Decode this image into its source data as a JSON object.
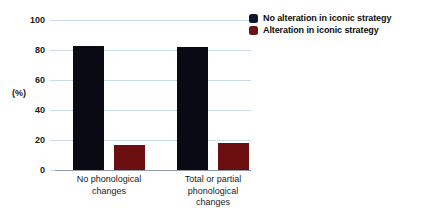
{
  "chart_data": {
    "type": "bar",
    "title": "",
    "xlabel": "",
    "ylabel": "(%)",
    "ylim": [
      0,
      100
    ],
    "yticks": [
      0,
      20,
      40,
      60,
      80,
      100
    ],
    "ytick_labels": [
      "0",
      "20",
      "40",
      "60",
      "80",
      "100"
    ],
    "grid": true,
    "legend_position": "top-right",
    "categories": [
      "No phonological\nchanges",
      "Total or partial\nphonological\nchanges"
    ],
    "series": [
      {
        "name": "No alteration in iconic strategy",
        "color": "#0a0a14",
        "values": [
          83,
          82
        ]
      },
      {
        "name": "Alteration in iconic strategy",
        "color": "#6b0f10",
        "values": [
          17,
          18
        ]
      }
    ]
  },
  "legend": {
    "items": [
      {
        "label": "No alteration in iconic strategy",
        "swatch_name": "legend-swatch-no-alteration"
      },
      {
        "label": "Alteration in iconic strategy",
        "swatch_name": "legend-swatch-alteration"
      }
    ]
  },
  "axes": {
    "y_title": "(%)"
  }
}
